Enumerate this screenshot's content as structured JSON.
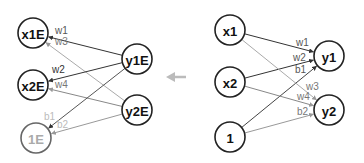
{
  "diagram": {
    "left_network": {
      "title": "backward (error) network",
      "nodes": [
        {
          "id": "x1E",
          "label": "x1E",
          "cx": 33,
          "cy": 33,
          "faint": false
        },
        {
          "id": "x2E",
          "label": "x2E",
          "cx": 33,
          "cy": 85,
          "faint": false
        },
        {
          "id": "1E",
          "label": "1E",
          "cx": 36,
          "cy": 138,
          "faint": true
        },
        {
          "id": "y1E",
          "label": "y1E",
          "cx": 137,
          "cy": 59,
          "faint": false
        },
        {
          "id": "y2E",
          "label": "y2E",
          "cx": 137,
          "cy": 110,
          "faint": false
        }
      ],
      "edges": [
        {
          "from": "y1E",
          "to": "x1E",
          "label": "w1",
          "color": "#333333",
          "lx": 55,
          "ly": 34,
          "lcolor": "#555555"
        },
        {
          "from": "y2E",
          "to": "x1E",
          "label": "w3",
          "color": "#aaaaaa",
          "lx": 55,
          "ly": 45,
          "lcolor": "#777777"
        },
        {
          "from": "y1E",
          "to": "x2E",
          "label": "w2",
          "color": "#333333",
          "lx": 52,
          "ly": 73,
          "lcolor": "#333333"
        },
        {
          "from": "y2E",
          "to": "x2E",
          "label": "w4",
          "color": "#888888",
          "lx": 55,
          "ly": 88,
          "lcolor": "#777777"
        },
        {
          "from": "y1E",
          "to": "1E",
          "label": "b1",
          "color": "#555555",
          "lx": 44,
          "ly": 120,
          "lcolor": "#bbbbbb"
        },
        {
          "from": "y2E",
          "to": "1E",
          "label": "b2",
          "color": "#999999",
          "lx": 57,
          "ly": 128,
          "lcolor": "#bbbbbb"
        }
      ]
    },
    "right_network": {
      "title": "forward network",
      "nodes": [
        {
          "id": "x1",
          "label": "x1",
          "cx": 230,
          "cy": 30,
          "faint": false
        },
        {
          "id": "x2",
          "label": "x2",
          "cx": 230,
          "cy": 82,
          "faint": false
        },
        {
          "id": "1",
          "label": "1",
          "cx": 230,
          "cy": 137,
          "faint": false
        },
        {
          "id": "y1",
          "label": "y1",
          "cx": 329,
          "cy": 56,
          "faint": false
        },
        {
          "id": "y2",
          "label": "y2",
          "cx": 329,
          "cy": 110,
          "faint": false
        }
      ],
      "edges": [
        {
          "from": "x1",
          "to": "y1",
          "label": "w1",
          "color": "#333333",
          "lx": 296,
          "ly": 46,
          "lcolor": "#555555"
        },
        {
          "from": "x2",
          "to": "y1",
          "label": "w2",
          "color": "#333333",
          "lx": 293,
          "ly": 61,
          "lcolor": "#555555"
        },
        {
          "from": "1",
          "to": "y1",
          "label": "b1",
          "color": "#444444",
          "lx": 295,
          "ly": 73,
          "lcolor": "#555555"
        },
        {
          "from": "x1",
          "to": "y2",
          "label": "w3",
          "color": "#aaaaaa",
          "lx": 306,
          "ly": 90,
          "lcolor": "#777777"
        },
        {
          "from": "x2",
          "to": "y2",
          "label": "w4",
          "color": "#888888",
          "lx": 297,
          "ly": 100,
          "lcolor": "#777777"
        },
        {
          "from": "1",
          "to": "y2",
          "label": "b2",
          "color": "#999999",
          "lx": 297,
          "ly": 115,
          "lcolor": "#777777"
        }
      ]
    },
    "direction_arrow": {
      "label": "←",
      "color": "#bbbbbb",
      "x": 172,
      "y": 77
    }
  }
}
